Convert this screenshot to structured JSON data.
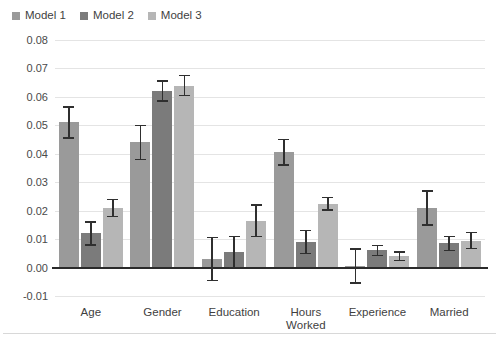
{
  "legend": {
    "position": "top-left",
    "entries": [
      {
        "label": "Model 1",
        "color": "#9a9a9a"
      },
      {
        "label": "Model 2",
        "color": "#7b7b7b"
      },
      {
        "label": "Model 3",
        "color": "#b6b6b6"
      }
    ]
  },
  "axis": {
    "y_ticks": [
      "0.08",
      "0.07",
      "0.06",
      "0.05",
      "0.04",
      "0.03",
      "0.02",
      "0.01",
      "0.00",
      "-0.01"
    ],
    "y_tick_values": [
      0.08,
      0.07,
      0.06,
      0.05,
      0.04,
      0.03,
      0.02,
      0.01,
      0.0,
      -0.01
    ],
    "x_labels": [
      "Age",
      "Gender",
      "Education",
      "Hours Worked",
      "Experience",
      "Married"
    ]
  },
  "chart_data": {
    "type": "bar",
    "title": "",
    "subtitle": "",
    "xlabel": "",
    "ylabel": "",
    "ylim": [
      -0.01,
      0.08
    ],
    "ytick_step": 0.01,
    "grid": true,
    "legend_position": "top-left",
    "error_bars": true,
    "error_bar_type": "symmetric",
    "zero_line": true,
    "categories": [
      "Age",
      "Gender",
      "Education",
      "Hours Worked",
      "Experience",
      "Married"
    ],
    "series": [
      {
        "name": "Model 1",
        "color": "#9a9a9a",
        "values": [
          0.051,
          0.044,
          0.003,
          0.0405,
          0.0005,
          0.021
        ],
        "errors": [
          0.0055,
          0.006,
          0.0075,
          0.0045,
          0.006,
          0.006
        ]
      },
      {
        "name": "Model 2",
        "color": "#7b7b7b",
        "values": [
          0.012,
          0.062,
          0.0055,
          0.009,
          0.006,
          0.0085
        ],
        "errors": [
          0.004,
          0.0035,
          0.0055,
          0.004,
          0.0018,
          0.0025
        ]
      },
      {
        "name": "Model 3",
        "color": "#b6b6b6",
        "values": [
          0.021,
          0.064,
          0.0165,
          0.0225,
          0.004,
          0.0095
        ],
        "errors": [
          0.003,
          0.0035,
          0.0055,
          0.0022,
          0.0015,
          0.0028
        ]
      }
    ]
  }
}
